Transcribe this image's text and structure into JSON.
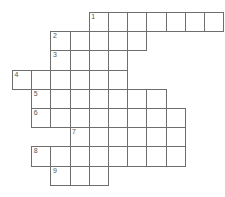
{
  "puzzle": {
    "type": "crossword-grid",
    "title": "",
    "cell_size_px": 19.2,
    "origin": {
      "x": 12,
      "y": 12
    },
    "columns": 11,
    "rows": 9,
    "colors": {
      "cell_fill": "#ffffff",
      "cell_border": "#6e6e6e",
      "number_text": "#555555",
      "background": "#ffffff"
    },
    "rows_data": [
      {
        "number": "1",
        "row": 0,
        "start_col": 4,
        "length": 7
      },
      {
        "number": "2",
        "row": 1,
        "start_col": 2,
        "length": 5
      },
      {
        "number": "3",
        "row": 2,
        "start_col": 2,
        "length": 4
      },
      {
        "number": "4",
        "row": 3,
        "start_col": 0,
        "length": 6
      },
      {
        "number": "5",
        "row": 4,
        "start_col": 1,
        "length": 7
      },
      {
        "number": "6",
        "row": 5,
        "start_col": 1,
        "length": 8
      },
      {
        "number": "7",
        "row": 6,
        "start_col": 3,
        "length": 6
      },
      {
        "number": "8",
        "row": 7,
        "start_col": 1,
        "length": 8
      },
      {
        "number": "9",
        "row": 8,
        "start_col": 2,
        "length": 3
      }
    ],
    "entry_numbers": [
      "1",
      "2",
      "3",
      "4",
      "5",
      "6",
      "7",
      "8",
      "9"
    ],
    "filled_letters": []
  }
}
